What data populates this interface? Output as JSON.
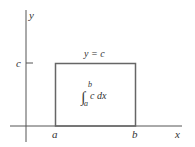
{
  "diagram": {
    "axes": {
      "x_label": "x",
      "y_label": "y"
    },
    "ticks": {
      "c_label": "c",
      "a_label": "a",
      "b_label": "b"
    },
    "curve_label": "y = c",
    "integral": {
      "symbol": "∫",
      "upper": "b",
      "lower": "a",
      "integrand": "c dx"
    },
    "colors": {
      "axis": "#555555",
      "rectangle": "#666666",
      "text": "#333333"
    }
  }
}
